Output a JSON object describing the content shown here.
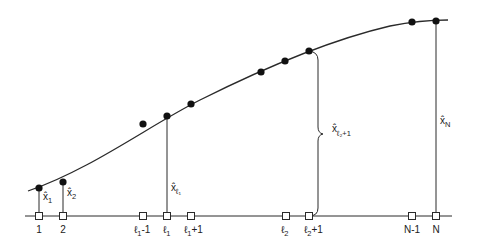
{
  "diagram": {
    "colors": {
      "line": "#2a2a2a",
      "dot": "#111111",
      "square_fill": "#ffffff"
    },
    "axis_labels": [
      {
        "id": "1",
        "text": "1"
      },
      {
        "id": "2",
        "text": "2"
      },
      {
        "id": "l1m1",
        "text": "ℓ",
        "sub": "1",
        "suffix": "-1"
      },
      {
        "id": "l1",
        "text": "ℓ",
        "sub": "1",
        "suffix": ""
      },
      {
        "id": "l1p1",
        "text": "ℓ",
        "sub": "1",
        "suffix": "+1"
      },
      {
        "id": "l2",
        "text": "ℓ",
        "sub": "2",
        "suffix": ""
      },
      {
        "id": "l2p1",
        "text": "ℓ",
        "sub": "2",
        "suffix": "+1"
      },
      {
        "id": "Nm1",
        "text": "N-1"
      },
      {
        "id": "N",
        "text": "N"
      }
    ],
    "estimate_labels": [
      {
        "id": "x1",
        "text": "x̂",
        "sub": "1"
      },
      {
        "id": "x2",
        "text": "x̂",
        "sub": "2"
      },
      {
        "id": "xl1",
        "text": "x̂",
        "sub": "ℓ₁"
      },
      {
        "id": "xl2p1",
        "text": "x̂",
        "sub": "ℓ₂+1"
      },
      {
        "id": "xN",
        "text": "x̂",
        "sub": "N"
      }
    ]
  }
}
